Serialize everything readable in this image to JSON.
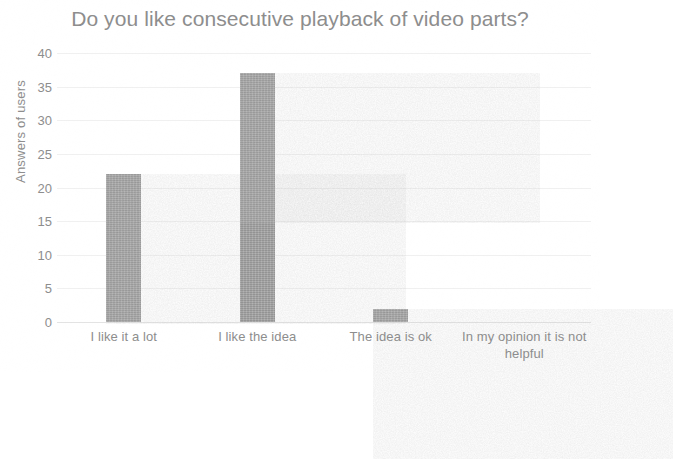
{
  "chart_data": {
    "type": "bar",
    "title": "Do you like consecutive playback of video parts?",
    "xlabel": "",
    "ylabel": "Answers of users",
    "categories": [
      "I like it a lot",
      "I like the idea",
      "The idea is ok",
      "In my opinion it is not helpful"
    ],
    "values": [
      22,
      37,
      2,
      0
    ],
    "ylim": [
      0,
      40
    ],
    "ytick_step": 5,
    "yticks": [
      0,
      5,
      10,
      15,
      20,
      25,
      30,
      35,
      40
    ],
    "ytick_labels": [
      "0",
      "5",
      "10",
      "15",
      "20",
      "25",
      "30",
      "35",
      "40"
    ],
    "grid": true,
    "legend": false,
    "series": [
      {
        "name": "Answers of users",
        "values": [
          22,
          37,
          2,
          0
        ]
      }
    ],
    "colors": {
      "bar": "#a3a3a3",
      "text": "#8d8d8d",
      "grid": "#f0f0f0",
      "background": "#ffffff"
    }
  }
}
